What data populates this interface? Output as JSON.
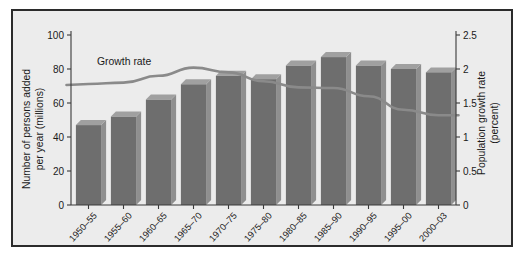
{
  "chart_data": {
    "type": "bar",
    "title": "",
    "subtitle": "",
    "categories": [
      "1950–55",
      "1955–60",
      "1960–65",
      "1965–70",
      "1970–75",
      "1975–80",
      "1980–85",
      "1985–90",
      "1990–95",
      "1995–00",
      "2000–03"
    ],
    "series": [
      {
        "name": "Number of persons added per year (millions)",
        "type": "bar",
        "axis": "left",
        "values": [
          47,
          52,
          62,
          71,
          76,
          74,
          82,
          87,
          82,
          80,
          78
        ]
      },
      {
        "name": "Growth rate",
        "type": "line",
        "axis": "right",
        "values": [
          1.78,
          1.8,
          1.9,
          2.02,
          1.95,
          1.82,
          1.73,
          1.72,
          1.6,
          1.4,
          1.32
        ]
      }
    ],
    "xlabel": "",
    "ylabel": "Number of persons added per year (millions)",
    "y2label": "Population growth rate (percent)",
    "ylim": [
      0,
      100
    ],
    "y2lim": [
      0,
      2.5
    ],
    "yticks": [
      "0",
      "20",
      "40",
      "60",
      "80",
      "100"
    ],
    "ytick_values": [
      0,
      20,
      40,
      60,
      80,
      100
    ],
    "y2ticks": [
      "0",
      "0.5",
      "1",
      "1.5",
      "2",
      "2.5"
    ],
    "y2tick_values": [
      0,
      0.5,
      1,
      1.5,
      2,
      2.5
    ],
    "grid": false,
    "legend_position": "none",
    "annotations": [
      {
        "text": "Growth rate",
        "x_category": "1955–60",
        "y_value": 2.15
      }
    ]
  },
  "axes": {
    "left_title_line1": "Number of persons added",
    "left_title_line2": "per year (millions)",
    "right_title_line1": "Population growth rate",
    "right_title_line2": "(percent)"
  },
  "annotation": {
    "growth_rate_label": "Growth rate"
  },
  "colors": {
    "bar_face": "#6e6e6e",
    "bar_side": "#8f8f8f",
    "bar_top": "#a0a0a0",
    "line": "#8a8a8a",
    "background": "#ececec",
    "frame": "#2b2b2b",
    "text": "#1a1a1a"
  }
}
